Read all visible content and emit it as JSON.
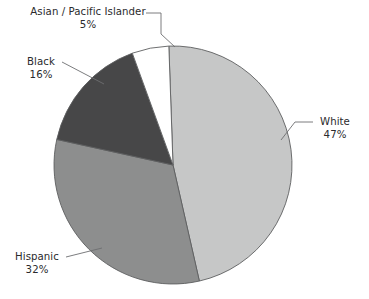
{
  "chart_data": {
    "type": "pie",
    "title": "",
    "subtitle": "",
    "xlabel": "",
    "ylabel": "",
    "legend_position": "none",
    "grid": false,
    "labels_outside": true,
    "unit": "%",
    "categories": [
      "White",
      "Hispanic",
      "Black",
      "Asian / Pacific Islander"
    ],
    "values": [
      47,
      32,
      16,
      5
    ],
    "slices": [
      {
        "label": "White",
        "value": 47,
        "value_text": "47%",
        "color": "#c6c7c7",
        "start_angle_deg": 0,
        "end_angle_deg": 169.2
      },
      {
        "label": "Hispanic",
        "value": 32,
        "value_text": "32%",
        "color": "#8d8e8e",
        "start_angle_deg": 169.2,
        "end_angle_deg": 284.4
      },
      {
        "label": "Black",
        "value": 16,
        "value_text": "16%",
        "color": "#474748",
        "start_angle_deg": 284.4,
        "end_angle_deg": 342.0
      },
      {
        "label": "Asian / Pacific Islander",
        "value": 5,
        "value_text": "5%",
        "color": "#ffffff",
        "start_angle_deg": 342.0,
        "end_angle_deg": 360.0
      }
    ]
  },
  "chart": {
    "background": "#ffffff",
    "outline_color": "#5e5f60",
    "leader_color": "#6d6e70",
    "text_color": "#2a2a2c",
    "center_x": 173,
    "center_y": 165,
    "radius": 119
  },
  "labels": {
    "asian": {
      "name": "Asian / Pacific Islander",
      "percent": "5%"
    },
    "black": {
      "name": "Black",
      "percent": "16%"
    },
    "hispanic": {
      "name": "Hispanic",
      "percent": "32%"
    },
    "white": {
      "name": "White",
      "percent": "47%"
    }
  }
}
